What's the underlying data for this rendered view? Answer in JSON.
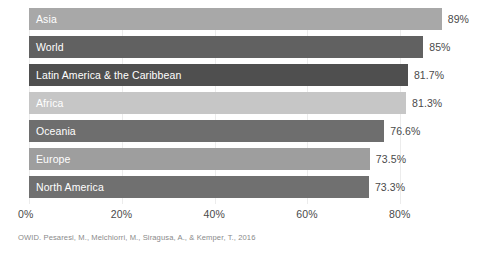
{
  "chart_data": {
    "type": "bar",
    "orientation": "horizontal",
    "title": "",
    "subtitle": "",
    "xlabel": "",
    "ylabel": "",
    "categories": [
      "Asia",
      "World",
      "Latin America & the Caribbean",
      "Africa",
      "Oceania",
      "Europe",
      "North America"
    ],
    "values": [
      89,
      85,
      81.7,
      81.3,
      76.6,
      73.5,
      73.3
    ],
    "value_labels": [
      "89%",
      "85%",
      "81.7%",
      "81.3%",
      "76.6%",
      "73.5%",
      "73.3%"
    ],
    "bar_colors": [
      "#a8a8a8",
      "#616161",
      "#4f4f4f",
      "#c6c6c6",
      "#6e6e6e",
      "#9e9e9e",
      "#707070"
    ],
    "xlim": [
      0,
      80
    ],
    "xticks": [
      0,
      20,
      40,
      60,
      80
    ],
    "xtick_labels": [
      "0%",
      "20%",
      "40%",
      "60%",
      "80%"
    ],
    "grid": true,
    "grid_axis": "x",
    "grid_color": "#ececec",
    "legend": false,
    "legend_position": "none",
    "label_position": "inside-left",
    "label_color": "#ffffff",
    "value_label_color": "#4a4a4a",
    "background_color": "#ffffff"
  },
  "footer": {
    "source": "OWID. Pesaresi, M., Melchiorri, M., Siragusa, A., & Kemper, T., 2016"
  }
}
